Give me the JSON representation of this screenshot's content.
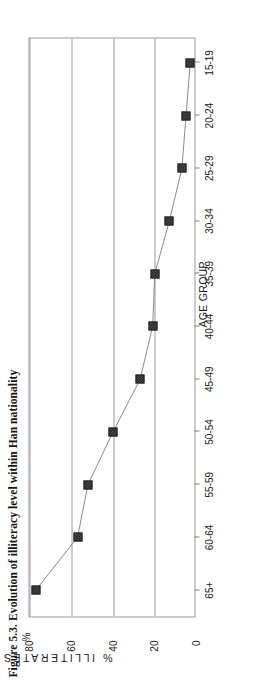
{
  "figure": {
    "title": "Figure 5.3. Evolution of illiteracy level within Han nationality",
    "percent_symbol": "%"
  },
  "chart_data": {
    "type": "line",
    "title": "Figure 5.3. Evolution of illiteracy level within Han nationality",
    "xlabel": "AGE GROUP",
    "ylabel": "% ILLITERATES",
    "categories": [
      "65+",
      "60-64",
      "55-59",
      "50-54",
      "45-49",
      "40-44",
      "35-39",
      "30-34",
      "25-29",
      "20-24",
      "15-19"
    ],
    "values": [
      77,
      57,
      52,
      40,
      27,
      21,
      20,
      13,
      7,
      5,
      3
    ],
    "ylim": [
      0,
      80
    ],
    "yticks": [
      0,
      20,
      40,
      60,
      80
    ],
    "ytick_labels": [
      "0",
      "20",
      "40",
      "60",
      "80"
    ],
    "grid": "horizontal-only",
    "legend": "none",
    "marker": "filled-square",
    "line_color": "#8a8a8a",
    "marker_color": "#2b2b2b"
  }
}
